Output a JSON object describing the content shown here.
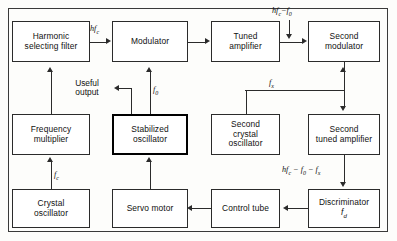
{
  "diagram": {
    "type": "block-diagram",
    "frame": {
      "visible": true
    },
    "blocks": [
      {
        "id": "harmonic-selecting-filter",
        "label": "Harmonic\nselecting filter",
        "bold": false
      },
      {
        "id": "modulator",
        "label": "Modulator",
        "bold": false
      },
      {
        "id": "tuned-amplifier",
        "label": "Tuned\namplifier",
        "bold": false
      },
      {
        "id": "second-modulator",
        "label": "Second\nmodulator",
        "bold": false
      },
      {
        "id": "frequency-multiplier",
        "label": "Frequency\nmultiplier",
        "bold": false
      },
      {
        "id": "stabilized-oscillator",
        "label": "Stabilized\noscillator",
        "bold": true
      },
      {
        "id": "second-crystal-oscillator",
        "label": "Second\ncrystal\noscillator",
        "bold": false
      },
      {
        "id": "second-tuned-amplifier",
        "label": "Second\ntuned amplifier",
        "bold": false
      },
      {
        "id": "crystal-oscillator",
        "label": "Crystal\noscillator",
        "bold": false
      },
      {
        "id": "servo-motor",
        "label": "Servo motor",
        "bold": false
      },
      {
        "id": "control-tube",
        "label": "Control tube",
        "bold": false
      },
      {
        "id": "discriminator",
        "label": "Discriminator",
        "sub": "f",
        "sub_index": "d",
        "bold": false
      }
    ],
    "signal_labels": [
      {
        "id": "hfc-top-left",
        "text": "hf",
        "sub": "c",
        "tail": ""
      },
      {
        "id": "hfc-minus-f0",
        "text": "hf",
        "sub": "c",
        "tail": "−f₀"
      },
      {
        "id": "f0",
        "text": "f",
        "sub": "0",
        "tail": ""
      },
      {
        "id": "fx",
        "text": "f",
        "sub": "x",
        "tail": ""
      },
      {
        "id": "fc",
        "text": "f",
        "sub": "c",
        "tail": ""
      },
      {
        "id": "hfc-minus-f0-minus-fx",
        "text": "hf",
        "sub": "c",
        "tail": " − f₀ − fₓ"
      },
      {
        "id": "fd",
        "text": "f",
        "sub": "d",
        "tail": ""
      }
    ],
    "annotations": [
      {
        "id": "useful-output",
        "text": "Useful\noutput"
      }
    ],
    "colors": {
      "ink": "#2b2b2b",
      "paper": "#fdfdfb",
      "frame": "#3a3a3a"
    }
  }
}
